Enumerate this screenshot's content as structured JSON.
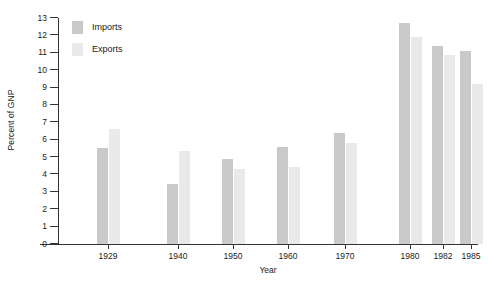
{
  "chart_data": {
    "type": "bar",
    "title": "",
    "xlabel": "Year",
    "ylabel": "Percent of GNP",
    "categories": [
      "1929",
      "1940",
      "1950",
      "1960",
      "1970",
      "1980",
      "1982",
      "1985"
    ],
    "series": [
      {
        "name": "Imports",
        "values": [
          5.5,
          3.45,
          4.9,
          5.6,
          6.4,
          12.7,
          11.4,
          11.1
        ],
        "color": "#c9c9c9"
      },
      {
        "name": "Exports",
        "values": [
          6.6,
          5.35,
          4.3,
          4.45,
          5.8,
          11.9,
          10.9,
          9.2
        ],
        "color": "#e9e9e9"
      }
    ],
    "ylim": [
      0,
      13
    ],
    "yticks": [
      "0",
      "1",
      "2",
      "3",
      "4",
      "5",
      "6",
      "7",
      "8",
      "9",
      "10",
      "11",
      "12",
      "13"
    ],
    "grid": false,
    "legend_position": "top-left",
    "axis_color": "#333333",
    "background": "#ffffff"
  },
  "legend": {
    "items": [
      {
        "label": "Imports"
      },
      {
        "label": "Exports"
      }
    ]
  }
}
